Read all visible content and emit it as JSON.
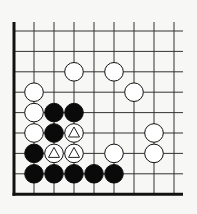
{
  "diagram": {
    "type": "go-board-fragment",
    "grid": {
      "origin_x": 14,
      "origin_y": 31,
      "spacing_x": 20,
      "spacing_y": 20.4,
      "cols": 9,
      "rows": 9,
      "left_edge": true,
      "bottom_edge": true,
      "line_color": "#333333",
      "edge_color": "#111111"
    },
    "stones": [
      {
        "color": "white",
        "col": 3,
        "row": 2
      },
      {
        "color": "white",
        "col": 5,
        "row": 2
      },
      {
        "color": "white",
        "col": 6,
        "row": 3
      },
      {
        "color": "white",
        "col": 1,
        "row": 3
      },
      {
        "color": "white",
        "col": 1,
        "row": 4
      },
      {
        "color": "white",
        "col": 1,
        "row": 5
      },
      {
        "color": "white",
        "col": 7,
        "row": 5
      },
      {
        "color": "white",
        "col": 7,
        "row": 6
      },
      {
        "color": "white",
        "col": 5,
        "row": 6
      },
      {
        "color": "white",
        "col": 3,
        "row": 5,
        "mark": "triangle"
      },
      {
        "color": "white",
        "col": 2,
        "row": 6,
        "mark": "triangle"
      },
      {
        "color": "white",
        "col": 3,
        "row": 6,
        "mark": "triangle"
      },
      {
        "color": "black",
        "col": 2,
        "row": 4
      },
      {
        "color": "black",
        "col": 3,
        "row": 4
      },
      {
        "color": "black",
        "col": 2,
        "row": 5
      },
      {
        "color": "black",
        "col": 1,
        "row": 6
      },
      {
        "color": "black",
        "col": 1,
        "row": 7
      },
      {
        "color": "black",
        "col": 2,
        "row": 7
      },
      {
        "color": "black",
        "col": 3,
        "row": 7
      },
      {
        "color": "black",
        "col": 4,
        "row": 7
      },
      {
        "color": "black",
        "col": 5,
        "row": 7
      }
    ]
  }
}
